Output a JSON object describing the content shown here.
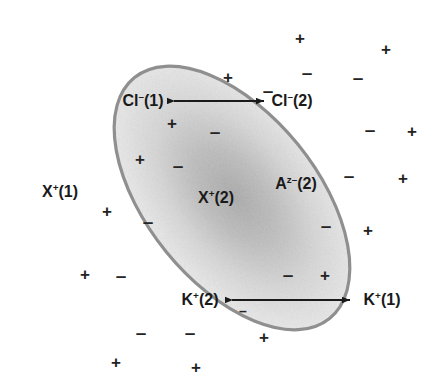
{
  "figure": {
    "type": "donnan-equilibrium-diagram",
    "background_color": "#ffffff",
    "ellipse": {
      "center_x": 232,
      "center_y": 198,
      "radius_x": 85,
      "radius_y": 155,
      "rotation_deg": -39,
      "stroke_color": "#8f8f8f",
      "stroke_width": 3.2,
      "fill_light": "#ededed",
      "fill_dark": "#b4b4b4"
    }
  },
  "labels": [
    {
      "name": "label-cl-1",
      "x": 143,
      "y": 101,
      "html": "Cl<sup>–</sup>(1)"
    },
    {
      "name": "label-cl-2",
      "x": 292,
      "y": 101,
      "html": "Cl<sup>–</sup>(2)"
    },
    {
      "name": "label-x-1",
      "x": 60,
      "y": 192,
      "html": "X<sup>+</sup>(1)"
    },
    {
      "name": "label-x-2",
      "x": 216,
      "y": 198,
      "html": "X<sup>+</sup>(2)"
    },
    {
      "name": "label-a-z-2",
      "x": 296,
      "y": 184,
      "html": "A<sup>z–</sup>(2)"
    },
    {
      "name": "label-k-2",
      "x": 200,
      "y": 300,
      "html": "K<sup>+</sup>(2)"
    },
    {
      "name": "label-k-1",
      "x": 382,
      "y": 300,
      "html": "K<sup>+</sup>(1)"
    }
  ],
  "arrows": [
    {
      "name": "arrow-chloride-exchange",
      "x1": 174,
      "y1": 101,
      "x2": 264,
      "y2": 101,
      "double_headed": true,
      "color": "#1a1a1a"
    },
    {
      "name": "arrow-potassium-exchange",
      "x1": 232,
      "y1": 300,
      "x2": 350,
      "y2": 300,
      "double_headed": true,
      "color": "#1a1a1a"
    }
  ],
  "charges": [
    {
      "name": "charge-plus-outside-top",
      "sign": "+",
      "x": 300,
      "y": 38,
      "size": "plus"
    },
    {
      "name": "charge-plus-outside-top-right",
      "sign": "+",
      "x": 386,
      "y": 49,
      "size": "plus"
    },
    {
      "name": "charge-plus-outside-upper-left",
      "sign": "+",
      "x": 228,
      "y": 77,
      "size": "plus"
    },
    {
      "name": "charge-plus-outside-left-upper",
      "sign": "+",
      "x": 172,
      "y": 123,
      "size": "plus"
    },
    {
      "name": "charge-plus-outside-left-mid",
      "sign": "+",
      "x": 140,
      "y": 159,
      "size": "plus"
    },
    {
      "name": "charge-plus-outside-left-low",
      "sign": "+",
      "x": 107,
      "y": 211,
      "size": "plus"
    },
    {
      "name": "charge-plus-outside-left-bot",
      "sign": "+",
      "x": 85,
      "y": 274,
      "size": "plus"
    },
    {
      "name": "charge-plus-outside-bottom-left",
      "sign": "+",
      "x": 116,
      "y": 362,
      "size": "plus"
    },
    {
      "name": "charge-plus-outside-bottom",
      "sign": "+",
      "x": 196,
      "y": 367,
      "size": "plus"
    },
    {
      "name": "charge-plus-outside-bottom-rt",
      "sign": "+",
      "x": 264,
      "y": 337,
      "size": "plus"
    },
    {
      "name": "charge-plus-outside-right-low",
      "sign": "+",
      "x": 325,
      "y": 275,
      "size": "plus"
    },
    {
      "name": "charge-plus-outside-right-mid",
      "sign": "+",
      "x": 368,
      "y": 230,
      "size": "plus"
    },
    {
      "name": "charge-plus-outside-right-up",
      "sign": "+",
      "x": 403,
      "y": 178,
      "size": "plus"
    },
    {
      "name": "charge-plus-outside-right-top",
      "sign": "+",
      "x": 412,
      "y": 131,
      "size": "plus"
    },
    {
      "name": "charge-minus-inside-top-a",
      "sign": "–",
      "x": 307,
      "y": 72,
      "size": "minus"
    },
    {
      "name": "charge-minus-inside-top-b",
      "sign": "–",
      "x": 358,
      "y": 77,
      "size": "minus"
    },
    {
      "name": "charge-minus-inside-upper-mid",
      "sign": "–",
      "x": 268,
      "y": 90,
      "size": "minus"
    },
    {
      "name": "charge-minus-inside-right-up",
      "sign": "–",
      "x": 370,
      "y": 129,
      "size": "minus"
    },
    {
      "name": "charge-minus-inside-left-up",
      "sign": "–",
      "x": 215,
      "y": 131,
      "size": "minus"
    },
    {
      "name": "charge-minus-inside-left-mid",
      "sign": "–",
      "x": 178,
      "y": 165,
      "size": "minus"
    },
    {
      "name": "charge-minus-inside-right-mid",
      "sign": "–",
      "x": 349,
      "y": 175,
      "size": "minus"
    },
    {
      "name": "charge-minus-inside-right-low",
      "sign": "–",
      "x": 326,
      "y": 225,
      "size": "minus"
    },
    {
      "name": "charge-minus-inside-left-low",
      "sign": "–",
      "x": 148,
      "y": 221,
      "size": "minus"
    },
    {
      "name": "charge-minus-inside-left-bot",
      "sign": "–",
      "x": 121,
      "y": 275,
      "size": "minus"
    },
    {
      "name": "charge-minus-inside-bot-right",
      "sign": "–",
      "x": 288,
      "y": 274,
      "size": "minus"
    },
    {
      "name": "charge-minus-inside-below-k2",
      "sign": "–",
      "x": 243,
      "y": 311,
      "size": "small"
    },
    {
      "name": "charge-minus-inside-bottom-a",
      "sign": "–",
      "x": 141,
      "y": 332,
      "size": "minus"
    },
    {
      "name": "charge-minus-inside-bottom-b",
      "sign": "–",
      "x": 190,
      "y": 332,
      "size": "minus"
    }
  ],
  "colors": {
    "ellipse_stroke": "#8f8f8f",
    "text": "#1a1a1a",
    "charge": "#232323",
    "arrow": "#1a1a1a"
  }
}
